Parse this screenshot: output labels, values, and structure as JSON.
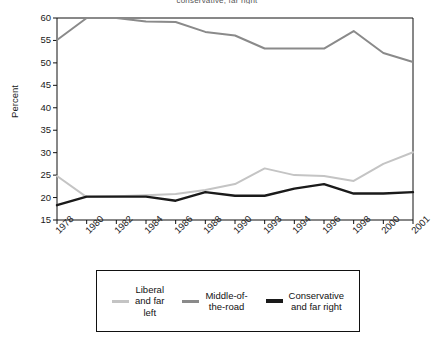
{
  "figure": {
    "top_title": "conservative, far right"
  },
  "axes": {
    "ylabel": "Percent",
    "ylim": [
      15,
      60
    ],
    "yticks": [
      60,
      55,
      50,
      45,
      40,
      35,
      30,
      25,
      20,
      15
    ],
    "xticks": [
      "1978",
      "1980",
      "1982",
      "1984",
      "1986",
      "1988",
      "1990",
      "1993",
      "1994",
      "1996",
      "1998",
      "2000",
      "2001"
    ]
  },
  "legend": {
    "entries": [
      {
        "label": "Liberal\nand far\nleft",
        "color": "#c4c4c4",
        "name": "liberal-and-far-left"
      },
      {
        "label": "Middle-of-\nthe-road",
        "color": "#8a8a8a",
        "name": "middle-of-the-road"
      },
      {
        "label": "Conservative\nand far right",
        "color": "#1a1a1a",
        "name": "conservative-and-far-right"
      }
    ]
  },
  "colors": {
    "liberal": "#c4c4c4",
    "middle": "#8a8a8a",
    "conservative": "#1a1a1a",
    "axis": "#111111",
    "background": "#ffffff"
  },
  "chart_data": {
    "type": "line",
    "title": "",
    "xlabel": "",
    "ylabel": "Percent",
    "ylim": [
      15,
      60
    ],
    "yticks": [
      15,
      20,
      25,
      30,
      35,
      40,
      45,
      50,
      55,
      60
    ],
    "grid": false,
    "legend_position": "bottom",
    "categories": [
      "1978",
      "1980",
      "1982",
      "1984",
      "1986",
      "1988",
      "1990",
      "1993",
      "1994",
      "1996",
      "1998",
      "2000",
      "2001"
    ],
    "series": [
      {
        "name": "Liberal and far left",
        "color": "#c4c4c4",
        "values": [
          24.8,
          20.1,
          20.3,
          20.5,
          20.8,
          21.7,
          23.0,
          26.5,
          25.0,
          24.8,
          23.7,
          27.5,
          30.1
        ]
      },
      {
        "name": "Middle-of-the-road",
        "color": "#8a8a8a",
        "values": [
          55.1,
          60.0,
          60.0,
          59.2,
          59.1,
          56.9,
          56.1,
          53.2,
          53.2,
          53.2,
          57.1,
          52.2,
          50.2
        ]
      },
      {
        "name": "Conservative and far right",
        "color": "#1a1a1a",
        "values": [
          18.3,
          20.2,
          20.2,
          20.2,
          19.3,
          21.2,
          20.4,
          20.4,
          22.0,
          23.0,
          20.9,
          20.9,
          21.2
        ]
      }
    ]
  }
}
